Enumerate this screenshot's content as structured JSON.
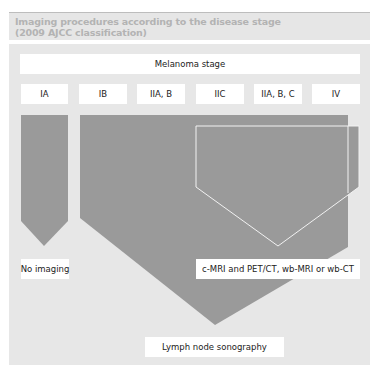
{
  "header": {
    "title_line1": "Imaging procedures according to the disease stage",
    "title_line2": "(2009 AJCC classification)"
  },
  "diagram": {
    "stage_header": "Melanoma stage",
    "stages": [
      "IA",
      "IB",
      "IIA, B",
      "IIC",
      "IIA, B, C",
      "IV"
    ],
    "outcomes": {
      "no_imaging": "No imaging",
      "advanced_imaging": "c-MRI and PET/CT, wb-MRI or wb-CT",
      "lymph_node": "Lymph node sonography"
    },
    "colors": {
      "panel_bg": "#e7e7e7",
      "arrow_fill": "#9a9a9a",
      "box_bg": "#ffffff",
      "title_text": "#b3b3b3"
    }
  }
}
